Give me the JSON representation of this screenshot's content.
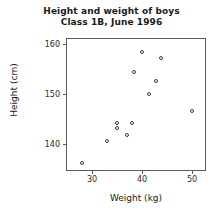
{
  "chart_data": {
    "type": "scatter",
    "title": "Height and weight of boys",
    "subtitle": "Class 1B, June 1996",
    "xlabel": "Weight (kg)",
    "ylabel": "Height (cm)",
    "xlim": [
      25,
      53
    ],
    "ylim": [
      134.5,
      161
    ],
    "xticks": [
      30,
      40,
      50
    ],
    "yticks": [
      140,
      150,
      160
    ],
    "xtick_labels": [
      "30",
      "40",
      "50"
    ],
    "ytick_labels": [
      "140",
      "150",
      "160"
    ],
    "grid": false,
    "legend": false,
    "marker": "open-circle",
    "marker_color": "#3d3d3d",
    "frame_color": "#5a5a5a",
    "background": "#ffffff",
    "n_points": 12,
    "points": [
      {
        "x": 28.0,
        "y": 136.2
      },
      {
        "x": 33.0,
        "y": 140.6
      },
      {
        "x": 35.0,
        "y": 143.2
      },
      {
        "x": 35.0,
        "y": 144.2
      },
      {
        "x": 37.0,
        "y": 141.8
      },
      {
        "x": 38.0,
        "y": 144.2
      },
      {
        "x": 38.4,
        "y": 154.4
      },
      {
        "x": 40.0,
        "y": 158.4
      },
      {
        "x": 41.4,
        "y": 150.0
      },
      {
        "x": 42.8,
        "y": 152.6
      },
      {
        "x": 43.8,
        "y": 157.2
      },
      {
        "x": 50.0,
        "y": 146.6
      }
    ]
  }
}
